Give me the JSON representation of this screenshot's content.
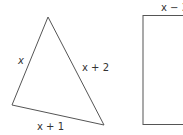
{
  "triangle": {
    "vertices": {
      "top": [
        48,
        17
      ],
      "bottom_left": [
        12,
        105
      ],
      "bottom_right": [
        104,
        125
      ]
    },
    "sides": {
      "left": "x",
      "right": "x + 2",
      "bottom": "x + 1"
    },
    "stroke_color": "#555555"
  },
  "rectangle": {
    "top_label": "x − 3",
    "x": 143,
    "y": 15,
    "width": 45,
    "height": 109,
    "stroke_color": "#555555"
  }
}
